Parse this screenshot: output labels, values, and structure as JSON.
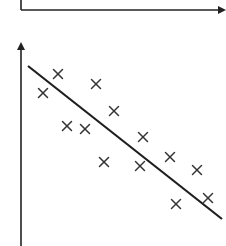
{
  "chart_data": [
    {
      "type": "line",
      "title": "",
      "xlabel": "",
      "ylabel": "",
      "grid": false,
      "legend": null,
      "description": "Empty axes (partially cropped at top) with x-axis arrow pointing right",
      "axes": {
        "origin_px": [
          21,
          10
        ],
        "x_end_px": 226
      }
    },
    {
      "type": "scatter",
      "title": "",
      "xlabel": "",
      "ylabel": "",
      "grid": false,
      "legend": null,
      "marker": "x",
      "description": "Scatter plot with negative linear trend and fitted regression line",
      "points_px": [
        [
          43,
          93
        ],
        [
          58,
          74
        ],
        [
          67,
          126
        ],
        [
          85,
          129
        ],
        [
          96,
          84
        ],
        [
          114,
          111
        ],
        [
          104,
          162
        ],
        [
          143,
          137
        ],
        [
          140,
          166
        ],
        [
          170,
          157
        ],
        [
          197,
          170
        ],
        [
          176,
          204
        ],
        [
          208,
          198
        ]
      ],
      "fit_line_px": [
        [
          28,
          66
        ],
        [
          222,
          219
        ]
      ],
      "axes": {
        "y_axis_x_px": 21,
        "y_axis_top_px": 40,
        "y_axis_bottom_px": 246
      },
      "colors": {
        "ink": "#222222",
        "background": "#ffffff"
      }
    }
  ]
}
